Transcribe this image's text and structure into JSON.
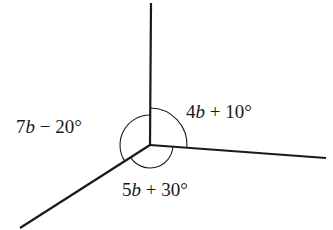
{
  "diagram": {
    "vertex": [
      150,
      145
    ],
    "rays": [
      {
        "name": "up",
        "end": [
          151,
          3
        ]
      },
      {
        "name": "right",
        "end": [
          326,
          158
        ]
      },
      {
        "name": "lower-left",
        "end": [
          20,
          228
        ]
      }
    ],
    "angles": [
      {
        "id": "upper-right",
        "coef": "4",
        "var": "b",
        "op": " + ",
        "const": "10°"
      },
      {
        "id": "left",
        "coef": "7",
        "var": "b",
        "op": " − ",
        "const": "20°"
      },
      {
        "id": "bottom",
        "coef": "5",
        "var": "b",
        "op": " + ",
        "const": "30°"
      }
    ],
    "stroke_color": "#1a1a1a"
  }
}
